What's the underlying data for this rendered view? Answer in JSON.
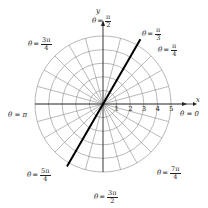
{
  "diagram": {
    "type": "polar-grid",
    "origin_px": [
      103,
      104
    ],
    "radius_step_px": 13.6,
    "circles": [
      1,
      2,
      3,
      4,
      5
    ],
    "radial_line_step_deg": 15,
    "highlighted_ray": {
      "theta": "π/3",
      "theta_deg": 60,
      "color": "#000000",
      "r_from": -5.3,
      "r_to": 5.5
    },
    "axes": {
      "x_label": "x",
      "y_label": "y"
    },
    "r_ticks": [
      "1",
      "2",
      "3",
      "4",
      "5"
    ],
    "angle_labels": [
      {
        "id": "pi-over-2",
        "prefix": "θ",
        "eq": "=",
        "num": "π",
        "den": "2",
        "x": 92,
        "y": 14
      },
      {
        "id": "pi-over-3",
        "prefix": "θ",
        "eq": "=",
        "num": "π",
        "den": "3",
        "x": 142,
        "y": 27
      },
      {
        "id": "pi-over-4",
        "prefix": "θ",
        "eq": "=",
        "num": "π",
        "den": "4",
        "x": 158,
        "y": 43
      },
      {
        "id": "three-pi-over-4",
        "prefix": "θ",
        "eq": "=",
        "num": "3π",
        "den": "4",
        "x": 28,
        "y": 37
      },
      {
        "id": "five-pi-over-4",
        "prefix": "θ",
        "eq": "=",
        "num": "5π",
        "den": "4",
        "x": 27,
        "y": 168
      },
      {
        "id": "seven-pi-over-4",
        "prefix": "θ",
        "eq": "=",
        "num": "7π",
        "den": "4",
        "x": 157,
        "y": 166
      },
      {
        "id": "three-pi-over-2",
        "prefix": "θ",
        "eq": "=",
        "num": "3π",
        "den": "2",
        "x": 94,
        "y": 190
      }
    ],
    "simple_labels": [
      {
        "id": "theta-pi",
        "text": "θ = π",
        "x": 8,
        "y": 112
      },
      {
        "id": "theta-zero",
        "text": "θ = 0",
        "x": 180,
        "y": 111
      }
    ],
    "colors": {
      "grid": "#8a8a8a",
      "axis": "#222222",
      "ray": "#000000",
      "background": "#ffffff"
    }
  }
}
